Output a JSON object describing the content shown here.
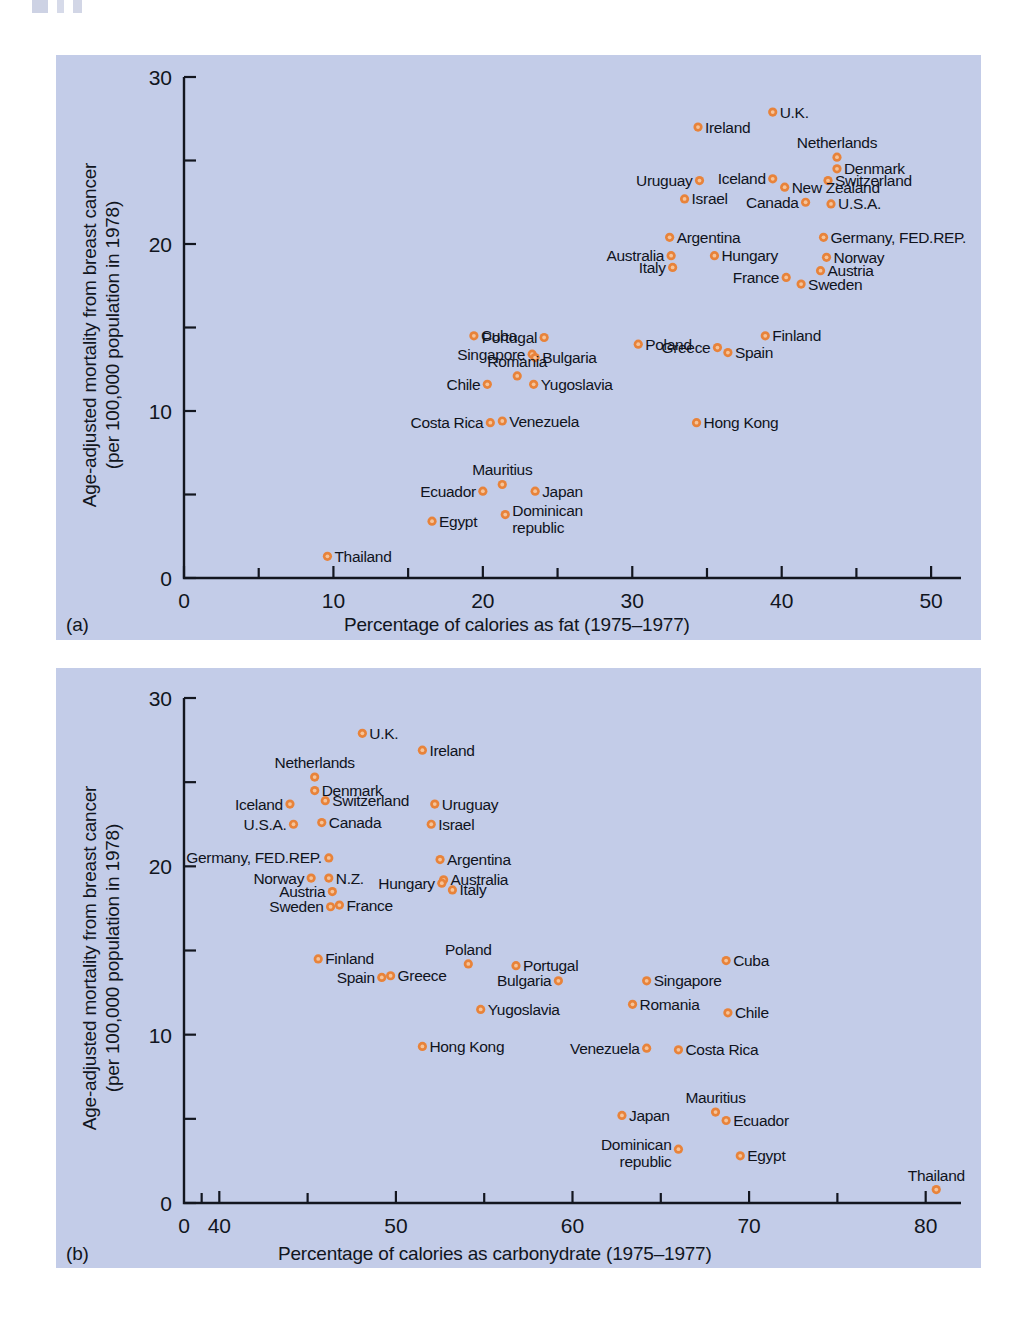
{
  "figure": {
    "background_color": "#c3cce8",
    "marker_color": "#e8833a",
    "text_color": "#111520"
  },
  "panel_a": {
    "tag": "(a)",
    "xlabel": "Percentage of calories as fat (1975–1977)",
    "ylabel_line1": "Age-adjusted mortality from breast cancer",
    "ylabel_line2": "(per 100,000 population in 1978)",
    "xticks": [
      "0",
      "10",
      "20",
      "30",
      "40",
      "50"
    ],
    "yticks": [
      "0",
      "10",
      "20",
      "30"
    ]
  },
  "panel_b": {
    "tag": "(b)",
    "xlabel": "Percentage of calories as carbonydrate (1975–1977)",
    "ylabel_line1": "Age-adjusted mortality from breast cancer",
    "ylabel_line2": "(per 100,000 population in 1978)",
    "xticks": [
      "0",
      "40",
      "50",
      "60",
      "70",
      "80"
    ],
    "yticks": [
      "0",
      "10",
      "20",
      "30"
    ]
  },
  "chart_data": [
    {
      "type": "scatter",
      "panel": "(a)",
      "title": "",
      "xlabel": "Percentage of calories as fat (1975–1977)",
      "ylabel": "Age-adjusted mortality from breast cancer (per 100,000 population in 1978)",
      "xlim": [
        0,
        52
      ],
      "ylim": [
        0,
        30
      ],
      "xticks": [
        0,
        10,
        20,
        30,
        40,
        50
      ],
      "yticks": [
        0,
        10,
        20,
        30
      ],
      "minor_xticks": [
        5,
        15,
        25,
        35,
        45
      ],
      "minor_yticks": [
        5,
        15,
        25
      ],
      "grid": false,
      "legend": "none",
      "axis_break": false,
      "points": [
        {
          "label": "U.K.",
          "x": 39.4,
          "y": 27.9,
          "label_pos": "right"
        },
        {
          "label": "Ireland",
          "x": 34.4,
          "y": 27.0,
          "label_pos": "right"
        },
        {
          "label": "Netherlands",
          "x": 43.7,
          "y": 25.2,
          "label_pos": "above"
        },
        {
          "label": "Denmark",
          "x": 43.7,
          "y": 24.5,
          "label_pos": "right"
        },
        {
          "label": "Switzerland",
          "x": 43.1,
          "y": 23.8,
          "label_pos": "right"
        },
        {
          "label": "New Zealand",
          "x": 40.2,
          "y": 23.4,
          "label_pos": "right"
        },
        {
          "label": "Iceland",
          "x": 39.4,
          "y": 23.9,
          "label_pos": "left"
        },
        {
          "label": "Uruguay",
          "x": 34.5,
          "y": 23.8,
          "label_pos": "left"
        },
        {
          "label": "Israel",
          "x": 33.5,
          "y": 22.7,
          "label_pos": "right"
        },
        {
          "label": "Canada",
          "x": 41.6,
          "y": 22.5,
          "label_pos": "left"
        },
        {
          "label": "U.S.A.",
          "x": 43.3,
          "y": 22.4,
          "label_pos": "right"
        },
        {
          "label": "Argentina",
          "x": 32.5,
          "y": 20.4,
          "label_pos": "right"
        },
        {
          "label": "Germany, FED.REP.",
          "x": 42.8,
          "y": 20.4,
          "label_pos": "right"
        },
        {
          "label": "Australia",
          "x": 32.6,
          "y": 19.3,
          "label_pos": "left"
        },
        {
          "label": "Hungary",
          "x": 35.5,
          "y": 19.3,
          "label_pos": "right"
        },
        {
          "label": "Norway",
          "x": 43.0,
          "y": 19.2,
          "label_pos": "right"
        },
        {
          "label": "Italy",
          "x": 32.7,
          "y": 18.6,
          "label_pos": "left"
        },
        {
          "label": "France",
          "x": 40.3,
          "y": 18.0,
          "label_pos": "left"
        },
        {
          "label": "Austria",
          "x": 42.6,
          "y": 18.4,
          "label_pos": "right"
        },
        {
          "label": "Sweden",
          "x": 41.3,
          "y": 17.6,
          "label_pos": "right"
        },
        {
          "label": "Finland",
          "x": 38.9,
          "y": 14.5,
          "label_pos": "right"
        },
        {
          "label": "Cuba",
          "x": 19.4,
          "y": 14.5,
          "label_pos": "right"
        },
        {
          "label": "Portugal",
          "x": 24.1,
          "y": 14.4,
          "label_pos": "left"
        },
        {
          "label": "Poland",
          "x": 30.4,
          "y": 14.0,
          "label_pos": "right"
        },
        {
          "label": "Spain",
          "x": 36.4,
          "y": 13.5,
          "label_pos": "right"
        },
        {
          "label": "Greece",
          "x": 35.7,
          "y": 13.8,
          "label_pos": "left"
        },
        {
          "label": "Singapore",
          "x": 23.3,
          "y": 13.4,
          "label_pos": "left"
        },
        {
          "label": "Bulgaria",
          "x": 23.5,
          "y": 13.2,
          "label_pos": "right"
        },
        {
          "label": "Romania",
          "x": 22.3,
          "y": 12.1,
          "label_pos": "above"
        },
        {
          "label": "Yugoslavia",
          "x": 23.4,
          "y": 11.6,
          "label_pos": "right"
        },
        {
          "label": "Chile",
          "x": 20.3,
          "y": 11.6,
          "label_pos": "left"
        },
        {
          "label": "Costa Rica",
          "x": 20.5,
          "y": 9.3,
          "label_pos": "left"
        },
        {
          "label": "Venezuela",
          "x": 21.3,
          "y": 9.4,
          "label_pos": "right"
        },
        {
          "label": "Hong Kong",
          "x": 34.3,
          "y": 9.3,
          "label_pos": "right"
        },
        {
          "label": "Mauritius",
          "x": 21.3,
          "y": 5.6,
          "label_pos": "above"
        },
        {
          "label": "Ecuador",
          "x": 20.0,
          "y": 5.2,
          "label_pos": "left"
        },
        {
          "label": "Japan",
          "x": 23.5,
          "y": 5.2,
          "label_pos": "right"
        },
        {
          "label": "Dominican republic",
          "x": 21.5,
          "y": 3.8,
          "label_pos": "right"
        },
        {
          "label": "Egypt",
          "x": 16.6,
          "y": 3.4,
          "label_pos": "right"
        },
        {
          "label": "Thailand",
          "x": 9.6,
          "y": 1.3,
          "label_pos": "right"
        }
      ]
    },
    {
      "type": "scatter",
      "panel": "(b)",
      "title": "",
      "xlabel": "Percentage of calories as carbonydrate (1975–1977)",
      "ylabel": "Age-adjusted mortality from breast cancer (per 100,000 population in 1978)",
      "xlim": [
        38,
        82
      ],
      "ylim": [
        0,
        30
      ],
      "xticks": [
        0,
        40,
        50,
        60,
        70,
        80
      ],
      "yticks": [
        0,
        10,
        20,
        30
      ],
      "minor_xticks": [
        45,
        55,
        65,
        75
      ],
      "minor_yticks": [
        5,
        15,
        25
      ],
      "grid": false,
      "legend": "none",
      "axis_break": true,
      "points": [
        {
          "label": "U.K.",
          "x": 48.1,
          "y": 27.9,
          "label_pos": "right"
        },
        {
          "label": "Ireland",
          "x": 51.5,
          "y": 26.9,
          "label_pos": "right"
        },
        {
          "label": "Netherlands",
          "x": 45.4,
          "y": 25.3,
          "label_pos": "above"
        },
        {
          "label": "Denmark",
          "x": 45.4,
          "y": 24.5,
          "label_pos": "right"
        },
        {
          "label": "Switzerland",
          "x": 46.0,
          "y": 23.9,
          "label_pos": "right"
        },
        {
          "label": "Iceland",
          "x": 44.0,
          "y": 23.7,
          "label_pos": "left"
        },
        {
          "label": "Uruguay",
          "x": 52.2,
          "y": 23.7,
          "label_pos": "right"
        },
        {
          "label": "U.S.A.",
          "x": 44.2,
          "y": 22.5,
          "label_pos": "left"
        },
        {
          "label": "Canada",
          "x": 45.8,
          "y": 22.6,
          "label_pos": "right"
        },
        {
          "label": "Israel",
          "x": 52.0,
          "y": 22.5,
          "label_pos": "right"
        },
        {
          "label": "Germany, FED.REP.",
          "x": 46.2,
          "y": 20.5,
          "label_pos": "left"
        },
        {
          "label": "Argentina",
          "x": 52.5,
          "y": 20.4,
          "label_pos": "right"
        },
        {
          "label": "Norway",
          "x": 45.2,
          "y": 19.3,
          "label_pos": "left"
        },
        {
          "label": "N.Z.",
          "x": 46.2,
          "y": 19.3,
          "label_pos": "right"
        },
        {
          "label": "Australia",
          "x": 52.7,
          "y": 19.2,
          "label_pos": "right"
        },
        {
          "label": "Hungary",
          "x": 52.6,
          "y": 19.0,
          "label_pos": "left"
        },
        {
          "label": "Austria",
          "x": 46.4,
          "y": 18.5,
          "label_pos": "left"
        },
        {
          "label": "Italy",
          "x": 53.2,
          "y": 18.6,
          "label_pos": "right"
        },
        {
          "label": "Sweden",
          "x": 46.3,
          "y": 17.6,
          "label_pos": "left"
        },
        {
          "label": "France",
          "x": 46.8,
          "y": 17.7,
          "label_pos": "right"
        },
        {
          "label": "Finland",
          "x": 45.6,
          "y": 14.5,
          "label_pos": "right"
        },
        {
          "label": "Poland",
          "x": 54.1,
          "y": 14.2,
          "label_pos": "above"
        },
        {
          "label": "Portugal",
          "x": 56.8,
          "y": 14.1,
          "label_pos": "right"
        },
        {
          "label": "Cuba",
          "x": 68.7,
          "y": 14.4,
          "label_pos": "right"
        },
        {
          "label": "Spain",
          "x": 49.2,
          "y": 13.4,
          "label_pos": "left"
        },
        {
          "label": "Greece",
          "x": 49.7,
          "y": 13.5,
          "label_pos": "right"
        },
        {
          "label": "Bulgaria",
          "x": 59.2,
          "y": 13.2,
          "label_pos": "left"
        },
        {
          "label": "Singapore",
          "x": 64.2,
          "y": 13.2,
          "label_pos": "right"
        },
        {
          "label": "Yugoslavia",
          "x": 54.8,
          "y": 11.5,
          "label_pos": "right"
        },
        {
          "label": "Romania",
          "x": 63.4,
          "y": 11.8,
          "label_pos": "right"
        },
        {
          "label": "Chile",
          "x": 68.8,
          "y": 11.3,
          "label_pos": "right"
        },
        {
          "label": "Hong Kong",
          "x": 51.5,
          "y": 9.3,
          "label_pos": "right"
        },
        {
          "label": "Venezuela",
          "x": 64.2,
          "y": 9.2,
          "label_pos": "left"
        },
        {
          "label": "Costa Rica",
          "x": 66.0,
          "y": 9.1,
          "label_pos": "right"
        },
        {
          "label": "Mauritius",
          "x": 68.1,
          "y": 5.4,
          "label_pos": "above"
        },
        {
          "label": "Ecuador",
          "x": 68.7,
          "y": 4.9,
          "label_pos": "right"
        },
        {
          "label": "Japan",
          "x": 62.8,
          "y": 5.2,
          "label_pos": "right"
        },
        {
          "label": "Dominican republic",
          "x": 66.0,
          "y": 3.2,
          "label_pos": "left"
        },
        {
          "label": "Egypt",
          "x": 69.5,
          "y": 2.8,
          "label_pos": "right"
        },
        {
          "label": "Thailand",
          "x": 80.6,
          "y": 0.8,
          "label_pos": "above"
        }
      ]
    }
  ]
}
